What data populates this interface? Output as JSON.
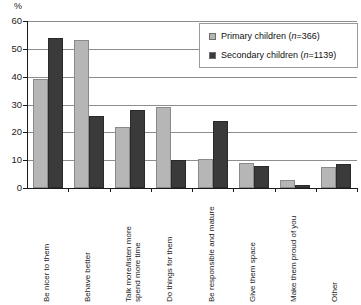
{
  "chart_data": {
    "type": "bar",
    "title": "",
    "subtitle": "",
    "xlabel": "",
    "ylabel": "%",
    "ylim": [
      0,
      60
    ],
    "ytick_step": 10,
    "yticks": [
      0,
      10,
      20,
      30,
      40,
      50,
      60
    ],
    "ytick_labels": [
      "0",
      "10",
      "20",
      "30",
      "40",
      "50",
      "60"
    ],
    "grid": true,
    "grid_axis": "y",
    "legend_position": "top-right",
    "categories": [
      "Be nicer to them",
      "Behave better",
      "Talk more/listen more\nspend more time",
      "Do things for them",
      "Be responsible and mature",
      "Give them space",
      "Make them proud of you",
      "Other"
    ],
    "series": [
      {
        "name": "Primary children (n=366)",
        "short_name": "Primary children",
        "n": 366,
        "color": "#b6b6b6",
        "values": [
          39,
          53,
          22,
          29,
          10.5,
          9,
          3,
          7.5
        ]
      },
      {
        "name": "Secondary children (n=1139)",
        "short_name": "Secondary children",
        "n": 1139,
        "color": "#3a3a3a",
        "values": [
          54,
          26,
          28,
          10,
          24,
          8,
          1,
          8.5
        ]
      }
    ]
  },
  "legend": {
    "items": [
      {
        "label_prefix": "Primary children (",
        "n_italic": "n",
        "label_suffix": "=366)",
        "full": "Primary children (n=366)"
      },
      {
        "label_prefix": "Secondary children (",
        "n_italic": "n",
        "label_suffix": "=1139)",
        "full": "Secondary children (n=1139)"
      }
    ]
  },
  "axis": {
    "unit_label": "%"
  }
}
